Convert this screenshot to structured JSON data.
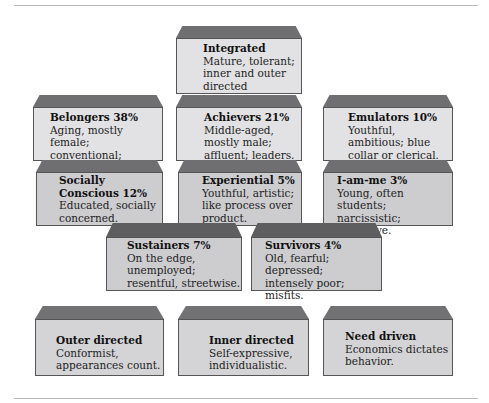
{
  "segments": {
    "integrated": {
      "title": "Integrated",
      "desc": [
        "Mature, tolerant;",
        "inner and outer",
        "directed"
      ]
    },
    "belongers": {
      "title": "Belongers 38%",
      "desc": [
        "Aging, mostly",
        "female; conventional;",
        "patriotic."
      ]
    },
    "achievers": {
      "title": "Achievers 21%",
      "desc": [
        "Middle-aged,",
        "mostly male;",
        "affluent; leaders."
      ]
    },
    "emulators": {
      "title": "Emulators 10%",
      "desc": [
        "Youthful,",
        "ambitious; blue",
        "collar or clerical."
      ]
    },
    "socially_conscious": {
      "title": [
        "Socially",
        "Conscious 12%"
      ],
      "desc": [
        "Educated, socially",
        "concerned."
      ]
    },
    "experiential": {
      "title": "Experiential 5%",
      "desc": [
        "Youthful, artistic;",
        "like process over",
        "product."
      ]
    },
    "i_am_me": {
      "title": "I-am-me 3%",
      "desc": [
        "Young, often students;",
        "narcissistic;",
        "impulsive."
      ]
    },
    "sustainers": {
      "title": "Sustainers 7%",
      "desc": [
        "On the edge,",
        "unemployed;",
        "resentful, streetwise."
      ]
    },
    "survivors": {
      "title": "Survivors 4%",
      "desc": [
        "Old, fearful; depressed;",
        "intensely poor;",
        "misfits."
      ]
    }
  },
  "legend": {
    "outer": {
      "title": "Outer directed",
      "desc": [
        "Conformist,",
        "appearances count."
      ]
    },
    "inner": {
      "title": "Inner directed",
      "desc": [
        "Self-expressive,",
        "individualistic."
      ]
    },
    "need": {
      "title": "Need driven",
      "desc": [
        "Economics dictates",
        "behavior."
      ]
    }
  },
  "colors": {
    "top_face": "#6f6f72",
    "front_light": "#e2e2e4",
    "front_mid": "#cdcdd0",
    "border": "#555555"
  }
}
